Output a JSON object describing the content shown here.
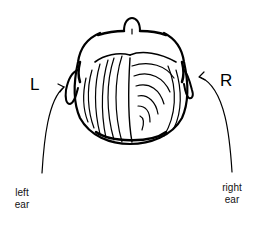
{
  "diagram": {
    "type": "top-down view of head (back of head / crown) with ear indicators",
    "labels": {
      "left_letter": "L",
      "right_letter": "R",
      "left_ear_line1": "left",
      "left_ear_line2": "ear",
      "right_ear_line1": "right",
      "right_ear_line2": "ear"
    },
    "colors": {
      "ink": "#000000",
      "background": "#ffffff"
    }
  }
}
